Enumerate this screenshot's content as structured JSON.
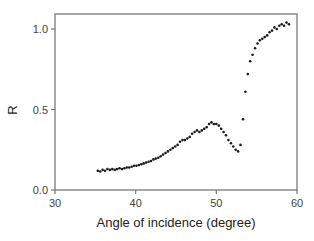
{
  "chart_data": {
    "type": "scatter",
    "title": "",
    "xlabel": "Angle of incidence (degree)",
    "ylabel": "R",
    "xlim": [
      30,
      60
    ],
    "ylim": [
      0.0,
      1.1
    ],
    "xticks": [
      30,
      40,
      50,
      60
    ],
    "xtick_labels": [
      "30",
      "40",
      "50",
      "60"
    ],
    "yticks": [
      0.0,
      0.5,
      1.0
    ],
    "ytick_labels": [
      "0.0",
      "0.5",
      "1.0"
    ],
    "grid": false,
    "legend": null,
    "marker_color": "#1a1a1a",
    "axis_color": "#777777",
    "series": [
      {
        "name": "R",
        "x": [
          35.3,
          35.6,
          35.9,
          36.2,
          36.5,
          36.8,
          37.1,
          37.4,
          37.7,
          38.0,
          38.3,
          38.6,
          38.9,
          39.2,
          39.5,
          39.8,
          40.1,
          40.4,
          40.7,
          41.0,
          41.3,
          41.6,
          41.9,
          42.2,
          42.5,
          42.8,
          43.1,
          43.4,
          43.7,
          44.0,
          44.3,
          44.6,
          44.9,
          45.2,
          45.5,
          45.8,
          46.1,
          46.4,
          46.7,
          47.0,
          47.3,
          47.6,
          47.9,
          48.2,
          48.5,
          48.8,
          49.1,
          49.4,
          49.7,
          50.0,
          50.3,
          50.6,
          50.9,
          51.2,
          51.5,
          51.8,
          52.1,
          52.4,
          52.7,
          53.0,
          53.3,
          53.6,
          53.9,
          54.2,
          54.5,
          54.8,
          55.1,
          55.4,
          55.7,
          56.0,
          56.3,
          56.6,
          56.9,
          57.2,
          57.5,
          57.8,
          58.1,
          58.4,
          58.7,
          59.0
        ],
        "y": [
          0.12,
          0.115,
          0.125,
          0.12,
          0.13,
          0.125,
          0.13,
          0.125,
          0.13,
          0.135,
          0.13,
          0.135,
          0.14,
          0.14,
          0.145,
          0.15,
          0.15,
          0.155,
          0.16,
          0.165,
          0.17,
          0.175,
          0.18,
          0.19,
          0.195,
          0.2,
          0.21,
          0.22,
          0.23,
          0.24,
          0.25,
          0.26,
          0.27,
          0.28,
          0.3,
          0.31,
          0.31,
          0.32,
          0.33,
          0.35,
          0.36,
          0.37,
          0.36,
          0.37,
          0.38,
          0.39,
          0.41,
          0.42,
          0.41,
          0.41,
          0.4,
          0.38,
          0.36,
          0.34,
          0.31,
          0.29,
          0.27,
          0.25,
          0.24,
          0.28,
          0.44,
          0.61,
          0.72,
          0.8,
          0.84,
          0.88,
          0.91,
          0.93,
          0.94,
          0.95,
          0.96,
          0.98,
          0.99,
          1.01,
          1.0,
          1.02,
          1.03,
          1.02,
          1.04,
          1.03
        ]
      }
    ]
  }
}
